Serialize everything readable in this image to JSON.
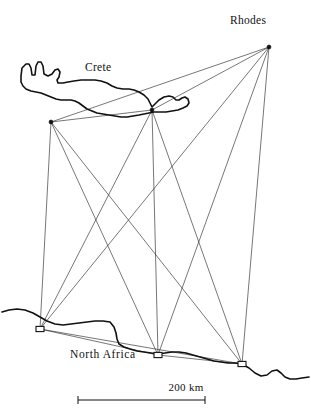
{
  "figure": {
    "type": "map",
    "background_color": "#ffffff",
    "ink_color": "#111111",
    "network_line_color": "#222222"
  },
  "labels": {
    "rhodes": "Rhodes",
    "crete": "Crete",
    "north_africa": "North Africa"
  },
  "scale_bar": {
    "label": "200 km",
    "length_px": 127,
    "x_start": 78,
    "x_end": 205,
    "y": 400,
    "tick_height": 8
  },
  "nodes": [
    {
      "id": "rhodes",
      "label": "Rhodes",
      "x": 269,
      "y": 47,
      "marker": "blob"
    },
    {
      "id": "crete_west",
      "label": "Crete west",
      "x": 51,
      "y": 122,
      "marker": "blob"
    },
    {
      "id": "crete_east",
      "label": "Crete east",
      "x": 152,
      "y": 110,
      "marker": "blob"
    },
    {
      "id": "africa_west",
      "label": "Africa west",
      "x": 40,
      "y": 329,
      "marker": "square"
    },
    {
      "id": "africa_mid",
      "label": "Africa central",
      "x": 158,
      "y": 355,
      "marker": "square"
    },
    {
      "id": "africa_east",
      "label": "Africa east",
      "x": 242,
      "y": 364,
      "marker": "square"
    }
  ],
  "edges": [
    {
      "from": "rhodes",
      "to": "crete_west"
    },
    {
      "from": "rhodes",
      "to": "crete_east"
    },
    {
      "from": "rhodes",
      "to": "africa_west"
    },
    {
      "from": "rhodes",
      "to": "africa_mid"
    },
    {
      "from": "rhodes",
      "to": "africa_east"
    },
    {
      "from": "crete_west",
      "to": "crete_east"
    },
    {
      "from": "crete_west",
      "to": "africa_west"
    },
    {
      "from": "crete_west",
      "to": "africa_mid"
    },
    {
      "from": "crete_west",
      "to": "africa_east"
    },
    {
      "from": "crete_east",
      "to": "africa_west"
    },
    {
      "from": "crete_east",
      "to": "africa_mid"
    },
    {
      "from": "crete_east",
      "to": "africa_east"
    },
    {
      "from": "africa_west",
      "to": "africa_mid"
    },
    {
      "from": "africa_west",
      "to": "africa_east"
    },
    {
      "from": "africa_mid",
      "to": "africa_east"
    }
  ],
  "coastlines": {
    "crete": "M 21 76 L 22 68 L 26 64 L 29 64 L 31 68 L 32 75 L 35 75 L 36 66 L 38 62 L 41 62 L 43 66 L 44 74 L 48 76 L 52 74 L 55 70 L 58 69 L 60 72 L 59 77 L 57 80 L 58 83 L 63 83 L 68 82 L 74 81 L 81 80 L 88 80 L 95 80 L 101 81 L 107 83 L 112 86 L 117 88 L 123 89 L 129 89 L 134 90 L 139 92 L 144 95 L 148 99 L 150 103 L 152 107 L 155 104 L 159 100 L 164 97 L 169 96 L 173 97 L 176 100 L 179 100 L 182 98 L 185 97 L 188 99 L 189 103 L 187 106 L 183 108 L 178 110 L 172 111 L 166 112 L 160 112 L 154 112 L 149 113 L 144 114 L 139 115 L 133 116 L 127 117 L 121 117 L 115 116 L 109 115 L 103 114 L 97 113 L 92 111 L 87 109 L 83 106 L 79 103 L 75 101 L 71 100 L 66 100 L 61 100 L 56 99 L 51 97 L 46 95 L 41 93 L 36 92 L 31 91 L 26 89 L 23 86 L 21 82 Z",
    "africa": "M 2 312 L 9 310 L 17 309 L 25 310 L 33 313 L 40 317 L 47 321 L 55 324 L 63 325 L 71 324 L 79 323 L 87 322 L 95 321 L 103 321 L 110 322 L 114 327 L 116 333 L 117 339 L 119 344 L 124 347 L 130 349 L 137 351 L 144 352 L 151 353 L 158 354 L 165 353 L 172 352 L 179 352 L 186 353 L 193 355 L 200 357 L 207 359 L 214 361 L 221 362 L 228 363 L 235 363 L 242 364 L 249 368 L 255 373 L 261 376 L 267 375 L 272 371 L 277 370 L 281 373 L 285 377 L 290 379 L 296 379 L 302 378 L 309 377"
  }
}
